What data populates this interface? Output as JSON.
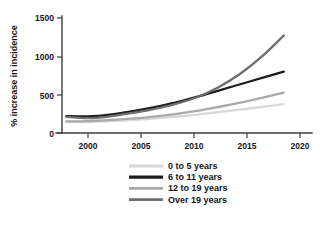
{
  "chart_data": {
    "type": "line",
    "title": "",
    "xlabel": "",
    "ylabel": "% increase in incidence",
    "xlim": [
      1997.6,
      2020.6
    ],
    "ylim": [
      0,
      1620
    ],
    "xticks": [
      2000,
      2005,
      2010,
      2015,
      2020
    ],
    "yticks": [
      0,
      500,
      1000,
      1500
    ],
    "xtick_labels": [
      "2000",
      "2005",
      "2010",
      "2015",
      "2020"
    ],
    "ytick_labels": [
      "0",
      "500",
      "1000",
      "1500"
    ],
    "grid": false,
    "legend_position": "below",
    "x": [
      1998,
      2000,
      2002,
      2004,
      2006,
      2008,
      2010,
      2012,
      2014,
      2016,
      2018
    ],
    "series": [
      {
        "name": "0 to 5 years",
        "color": "#d8d8d8",
        "values": [
          150,
          155,
          165,
          180,
          200,
          225,
          255,
          290,
          325,
          362,
          400
        ]
      },
      {
        "name": "6 to 11 years",
        "color": "#1c1c1c",
        "values": [
          235,
          230,
          255,
          300,
          355,
          420,
          500,
          588,
          675,
          762,
          850
        ]
      },
      {
        "name": "12 to 19 years",
        "color": "#a9a9a9",
        "values": [
          160,
          165,
          180,
          200,
          228,
          262,
          305,
          360,
          420,
          488,
          560
        ]
      },
      {
        "name": "Over 19 years",
        "color": "#6e6e6e",
        "values": [
          225,
          205,
          230,
          275,
          330,
          400,
          495,
          635,
          820,
          1060,
          1350
        ]
      }
    ]
  },
  "legend": {
    "entries": [
      {
        "label": "0 to 5 years"
      },
      {
        "label": "6 to 11 years"
      },
      {
        "label": "12 to 19 years"
      },
      {
        "label": "Over 19 years"
      }
    ]
  }
}
